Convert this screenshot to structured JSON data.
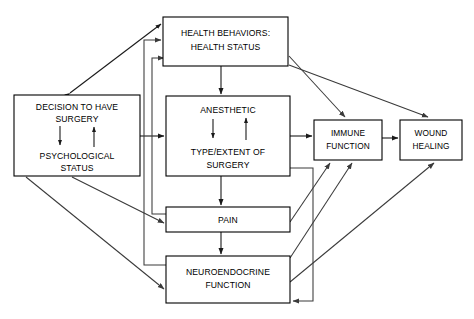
{
  "diagram": {
    "type": "flowchart",
    "title": "",
    "background_color": "#ffffff",
    "line_color": "#1a1a1a",
    "nodes": [
      {
        "id": "health_behaviors",
        "lines": [
          "HEALTH BEHAVIORS:",
          "HEALTH STATUS"
        ],
        "line1": "HEALTH BEHAVIORS:",
        "line2": "HEALTH STATUS",
        "x": 163,
        "y": 17,
        "w": 125,
        "h": 49
      },
      {
        "id": "decision_psych",
        "lines": [
          "DECISION TO HAVE",
          "SURGERY",
          "PSYCHOLOGICAL",
          "STATUS"
        ],
        "line1": "DECISION TO HAVE",
        "line2": "SURGERY",
        "line3": "PSYCHOLOGICAL",
        "line4": "STATUS",
        "x": 14,
        "y": 95,
        "w": 126,
        "h": 81
      },
      {
        "id": "anesthetic_surgery",
        "lines": [
          "ANESTHETIC",
          "TYPE/EXTENT OF",
          "SURGERY"
        ],
        "line1": "ANESTHETIC",
        "line2": "TYPE/EXTENT OF",
        "line3": "SURGERY",
        "x": 166,
        "y": 96,
        "w": 124,
        "h": 80
      },
      {
        "id": "pain",
        "lines": [
          "PAIN"
        ],
        "line1": "PAIN",
        "x": 166,
        "y": 207,
        "w": 124,
        "h": 25
      },
      {
        "id": "neuroendocrine",
        "lines": [
          "NEUROENDOCRINE",
          "FUNCTION"
        ],
        "line1": "NEUROENDOCRINE",
        "line2": "FUNCTION",
        "x": 166,
        "y": 256,
        "w": 124,
        "h": 47
      },
      {
        "id": "immune_function",
        "lines": [
          "IMMUNE",
          "FUNCTION"
        ],
        "line1": "IMMUNE",
        "line2": "FUNCTION",
        "x": 314,
        "y": 120,
        "w": 68,
        "h": 40
      },
      {
        "id": "wound_healing",
        "lines": [
          "WOUND",
          "HEALING"
        ],
        "line1": "WOUND",
        "line2": "HEALING",
        "x": 400,
        "y": 120,
        "w": 62,
        "h": 40
      }
    ],
    "edges": [
      {
        "from": "decision_psych",
        "to": "health_behaviors",
        "style": "bidirectional-diagonal"
      },
      {
        "from": "decision_surgery",
        "to": "psychological_status",
        "style": "internal-down"
      },
      {
        "from": "psychological_status",
        "to": "decision_surgery",
        "style": "internal-up"
      },
      {
        "from": "anesthetic",
        "to": "type_extent_surgery",
        "style": "internal-down"
      },
      {
        "from": "type_extent_surgery",
        "to": "anesthetic",
        "style": "internal-up"
      },
      {
        "from": "health_behaviors",
        "to": "anesthetic_surgery",
        "style": "vertical-down"
      },
      {
        "from": "health_behaviors",
        "to": "immune_function",
        "style": "diagonal"
      },
      {
        "from": "health_behaviors",
        "to": "wound_healing",
        "style": "diagonal"
      },
      {
        "from": "decision_psych",
        "to": "anesthetic_surgery",
        "style": "horizontal"
      },
      {
        "from": "decision_psych",
        "to": "pain",
        "style": "diagonal"
      },
      {
        "from": "decision_psych",
        "to": "neuroendocrine",
        "style": "diagonal"
      },
      {
        "from": "anesthetic_surgery",
        "to": "pain",
        "style": "vertical-down"
      },
      {
        "from": "anesthetic_surgery",
        "to": "immune_function",
        "style": "horizontal"
      },
      {
        "from": "anesthetic_surgery",
        "to": "neuroendocrine",
        "style": "routed-right"
      },
      {
        "from": "pain",
        "to": "neuroendocrine",
        "style": "vertical-down"
      },
      {
        "from": "pain",
        "to": "immune_function",
        "style": "diagonal"
      },
      {
        "from": "pain",
        "to": "health_behaviors",
        "style": "routed-left"
      },
      {
        "from": "neuroendocrine",
        "to": "immune_function",
        "style": "diagonal"
      },
      {
        "from": "neuroendocrine",
        "to": "wound_healing",
        "style": "diagonal"
      },
      {
        "from": "neuroendocrine",
        "to": "health_behaviors",
        "style": "routed-left"
      },
      {
        "from": "immune_function",
        "to": "wound_healing",
        "style": "horizontal"
      }
    ]
  }
}
